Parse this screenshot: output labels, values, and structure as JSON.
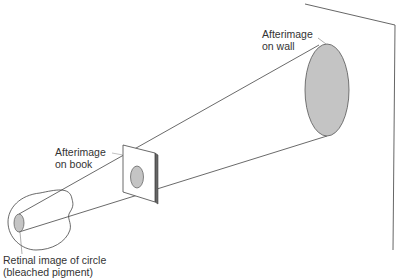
{
  "diagram": {
    "labels": {
      "wall_line1": "Afterimage",
      "wall_line2": "on wall",
      "book_line1": "Afterimage",
      "book_line2": "on book",
      "retina_line1": "Retinal image of circle",
      "retina_line2": "(bleached pigment)"
    },
    "colors": {
      "line": "#444444",
      "fill": "#c4c4c4",
      "text": "#333333"
    }
  }
}
